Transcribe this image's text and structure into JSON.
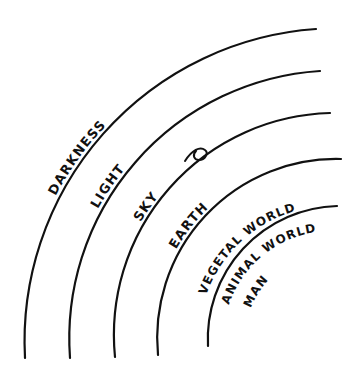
{
  "diagram": {
    "type": "concentric-arcs",
    "style": "hand-drawn",
    "background_color": "#ffffff",
    "stroke_color": "#111111",
    "text_color": "#111111",
    "canvas": {
      "width": 364,
      "height": 376
    },
    "center": {
      "x": 333,
      "y": 357
    },
    "rings": [
      {
        "id": "ring-darkness",
        "label": "DARKNESS",
        "order": 1,
        "position": "outermost",
        "radius": 313,
        "label_font_size": 13,
        "label_start_offset_pct": 34,
        "has_arc": true,
        "arc_start_deg": 180,
        "arc_end_deg": 267
      },
      {
        "id": "ring-light",
        "label": "LIGHT",
        "order": 2,
        "radius": 268,
        "label_font_size": 13,
        "label_start_offset_pct": 36,
        "has_arc": true,
        "arc_start_deg": 180,
        "arc_end_deg": 268
      },
      {
        "id": "ring-sky",
        "label": "SKY",
        "order": 3,
        "radius": 222,
        "label_font_size": 13,
        "label_start_offset_pct": 38,
        "has_arc": true,
        "arc_start_deg": 180,
        "arc_end_deg": 269
      },
      {
        "id": "ring-earth",
        "label": "EARTH",
        "order": 4,
        "radius": 179,
        "label_font_size": 13,
        "label_start_offset_pct": 36,
        "has_arc": true,
        "arc_start_deg": 180,
        "arc_end_deg": 270,
        "has_swash": true
      },
      {
        "id": "ring-vegetal-world",
        "label": "VEGETAL WORLD",
        "order": 5,
        "radius": 133,
        "label_font_size": 12,
        "label_start_offset_pct": 27,
        "has_arc": true,
        "arc_start_deg": 180,
        "arc_end_deg": 272
      },
      {
        "id": "ring-animal-world",
        "label": "ANIMAL WORLD",
        "order": 6,
        "radius": 108,
        "label_font_size": 12,
        "label_start_offset_pct": 28,
        "has_arc": false
      },
      {
        "id": "ring-man",
        "label": "MAN",
        "order": 7,
        "position": "innermost",
        "radius": 86,
        "label_font_size": 12,
        "label_start_offset_pct": 33,
        "has_arc": false
      }
    ]
  }
}
